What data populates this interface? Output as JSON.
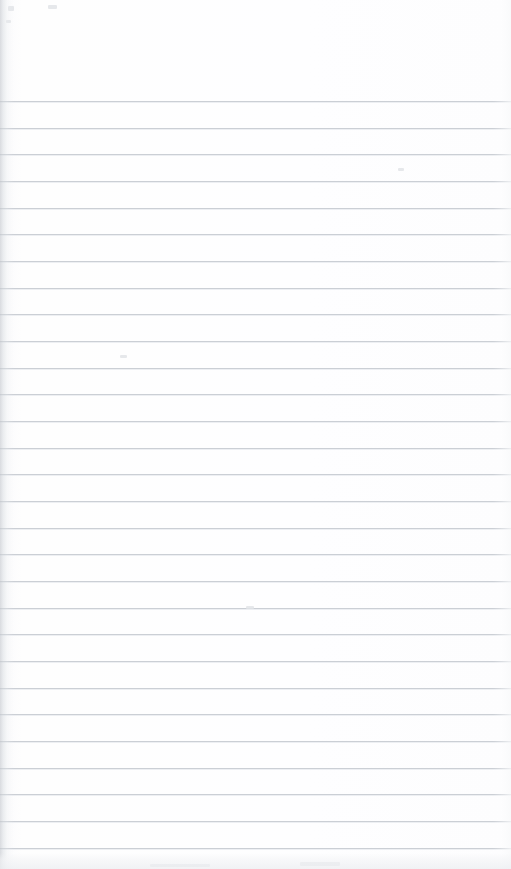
{
  "document": {
    "kind": "scanned-ruled-notebook-page",
    "title": "Blank ruled notebook page",
    "content_text": "",
    "width_px": 511,
    "height_px": 869
  },
  "paper": {
    "background_color": "#fdfdfe",
    "edge_shadow_color": "#c4c8ce",
    "bottom_band_color": "#ecedf1"
  },
  "ruling": {
    "line_color": "#c9cdd3",
    "line_thickness_px": 1,
    "line_spacing_px": 26.7,
    "first_line_y_px": 101,
    "line_count": 29,
    "top_margin_px": 100,
    "left_inset_px": 0,
    "right_inset_px": 0,
    "line_y_positions": [
      101,
      128,
      154,
      181,
      208,
      234,
      261,
      288,
      314,
      341,
      368,
      394,
      421,
      448,
      474,
      501,
      528,
      554,
      581,
      608,
      634,
      661,
      688,
      714,
      741,
      768,
      794,
      821,
      848
    ]
  },
  "speckles": [
    {
      "x": 8,
      "y": 6,
      "w": 6,
      "h": 5
    },
    {
      "x": 48,
      "y": 5,
      "w": 9,
      "h": 4
    },
    {
      "x": 6,
      "y": 20,
      "w": 5,
      "h": 3
    },
    {
      "x": 120,
      "y": 355,
      "w": 7,
      "h": 3
    },
    {
      "x": 246,
      "y": 606,
      "w": 8,
      "h": 3
    },
    {
      "x": 398,
      "y": 168,
      "w": 6,
      "h": 3
    },
    {
      "x": 300,
      "y": 862,
      "w": 40,
      "h": 4
    },
    {
      "x": 150,
      "y": 864,
      "w": 60,
      "h": 3
    }
  ],
  "annotations": {
    "handwriting_present": false,
    "printed_text_present": false,
    "margin_rule_present": false
  }
}
